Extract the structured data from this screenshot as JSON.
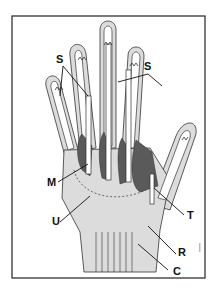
{
  "diagram": {
    "labels": {
      "s_left": "S",
      "s_right": "S",
      "m": "M",
      "u": "U",
      "t": "T",
      "r": "R",
      "c": "C"
    },
    "colors": {
      "frame": "#222222",
      "outline": "#333333",
      "skin": "#dcdcdc",
      "sheath": "#ffffff",
      "muscle": "#5a5a5a",
      "background": "#ffffff"
    }
  }
}
